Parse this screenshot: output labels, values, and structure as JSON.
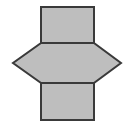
{
  "figure": {
    "canvas": {
      "width": 129,
      "height": 127,
      "background_color": "#ffffff"
    },
    "style": {
      "fill_color": "#bebebe",
      "stroke_color": "#3a3a3a",
      "stroke_width": 2,
      "inner_line_color": "#3a3a3a",
      "inner_line_width": 2
    },
    "geometry": {
      "square_left_x": 41,
      "square_right_x": 94,
      "square_width": 53,
      "top_y": 7,
      "divider_upper_y": 43,
      "divider_lower_y": 83,
      "bottom_y": 120,
      "left_apex_x": 13,
      "right_apex_x": 121,
      "apex_y": 63
    },
    "parts": [
      {
        "name": "top-square",
        "shape": "square",
        "points": "41,7 94,7 94,43 41,43"
      },
      {
        "name": "middle-square",
        "shape": "square",
        "points": "41,43 94,43 94,83 41,83"
      },
      {
        "name": "bottom-square",
        "shape": "square",
        "points": "41,83 94,83 94,120 41,120"
      },
      {
        "name": "left-triangle-flap",
        "shape": "triangle",
        "points": "41,43 13,63 41,83"
      },
      {
        "name": "right-triangle-flap",
        "shape": "triangle",
        "points": "94,43 121,63 94,83"
      }
    ],
    "outline_points": "41,7 94,7 94,43 121,63 94,83 94,120 41,120 41,83 13,63 41,43",
    "inner_lines": [
      {
        "name": "divider-upper",
        "x1": 41,
        "y1": 43,
        "x2": 94,
        "y2": 43
      },
      {
        "name": "divider-lower",
        "x1": 41,
        "y1": 83,
        "x2": 94,
        "y2": 83
      }
    ]
  }
}
